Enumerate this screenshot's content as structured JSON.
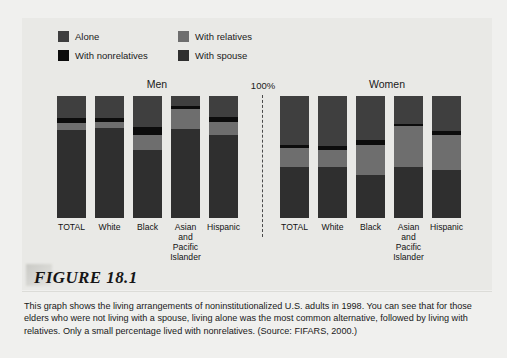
{
  "figure": {
    "heading": "FIGURE 18.1",
    "caption": "This graph shows the living arrangements of noninstitutionalized U.S. adults in 1998. You can see that for those elders who were not living with a spouse, living alone was the most common alternative, followed by living with relatives. Only a small percentage lived with nonrelatives. (Source: FIFARS, 2000.)"
  },
  "legend": {
    "items": [
      {
        "label": "Alone",
        "color": "#3f3f3f"
      },
      {
        "label": "With nonrelatives",
        "color": "#0c0c0c"
      },
      {
        "label": "With relatives",
        "color": "#6e6e6e"
      },
      {
        "label": "With spouse",
        "color": "#2f2f2f"
      }
    ]
  },
  "axis": {
    "top_label": "100%"
  },
  "groups": {
    "men": {
      "title": "Men"
    },
    "women": {
      "title": "Women"
    }
  },
  "chart_data": {
    "type": "bar",
    "subtype": "stacked-100-percent",
    "xlabel": "",
    "ylabel": "Percent",
    "ylim": [
      0,
      100
    ],
    "grid": false,
    "legend_position": "top-left",
    "series": [
      {
        "name": "Alone",
        "color": "#3f3f3f"
      },
      {
        "name": "With nonrelatives",
        "color": "#0c0c0c"
      },
      {
        "name": "With relatives",
        "color": "#6e6e6e"
      },
      {
        "name": "With spouse",
        "color": "#2f2f2f"
      }
    ],
    "panels": [
      {
        "name": "Men",
        "categories": [
          "TOTAL",
          "White",
          "Black",
          "Asian and Pacific Islander",
          "Hispanic"
        ],
        "category_lines": [
          [
            "TOTAL"
          ],
          [
            "White"
          ],
          [
            "Black"
          ],
          [
            "Asian",
            "and",
            "Pacific",
            "Islander"
          ],
          [
            "Hispanic"
          ]
        ],
        "values": {
          "Alone": [
            18,
            18,
            25,
            8,
            17
          ],
          "With nonrelatives": [
            4,
            3,
            7,
            3,
            4
          ],
          "With relatives": [
            6,
            5,
            12,
            16,
            11
          ],
          "With spouse": [
            72,
            74,
            56,
            73,
            68
          ]
        }
      },
      {
        "name": "Women",
        "categories": [
          "TOTAL",
          "White",
          "Black",
          "Asian and Pacific Islander",
          "Hispanic"
        ],
        "category_lines": [
          [
            "TOTAL"
          ],
          [
            "White"
          ],
          [
            "Black"
          ],
          [
            "Asian",
            "and",
            "Pacific",
            "Islander"
          ],
          [
            "Hispanic"
          ]
        ],
        "values": {
          "Alone": [
            40,
            41,
            36,
            23,
            29
          ],
          "With nonrelatives": [
            3,
            3,
            4,
            2,
            3
          ],
          "With relatives": [
            15,
            14,
            25,
            33,
            29
          ],
          "With spouse": [
            42,
            42,
            35,
            42,
            39
          ]
        }
      }
    ]
  }
}
